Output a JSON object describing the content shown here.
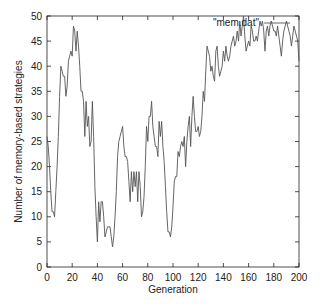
{
  "chart_data": {
    "type": "line",
    "title": "",
    "xlabel": "Generation",
    "ylabel": "Number of memory-based strategies",
    "xlim": [
      0,
      200
    ],
    "ylim": [
      0,
      50
    ],
    "xticks": [
      0,
      20,
      40,
      60,
      80,
      100,
      120,
      140,
      160,
      180,
      200
    ],
    "yticks": [
      0,
      5,
      10,
      15,
      20,
      25,
      30,
      35,
      40,
      45,
      50
    ],
    "grid": false,
    "legend": {
      "position": "top-right-inside",
      "entries": [
        "\"mem.dat\""
      ]
    },
    "series": [
      {
        "name": "\"mem.dat\"",
        "color": "#555555",
        "x": [
          0,
          1,
          2,
          3,
          4,
          5,
          6,
          7,
          8,
          9,
          10,
          11,
          12,
          13,
          14,
          15,
          16,
          17,
          18,
          19,
          20,
          21,
          22,
          23,
          24,
          25,
          26,
          27,
          28,
          29,
          30,
          31,
          32,
          33,
          34,
          35,
          36,
          37,
          38,
          39,
          40,
          41,
          42,
          43,
          44,
          45,
          46,
          47,
          48,
          49,
          50,
          51,
          52,
          53,
          54,
          55,
          56,
          57,
          58,
          59,
          60,
          61,
          62,
          63,
          64,
          65,
          66,
          67,
          68,
          69,
          70,
          71,
          72,
          73,
          74,
          75,
          76,
          77,
          78,
          79,
          80,
          81,
          82,
          83,
          84,
          85,
          86,
          87,
          88,
          89,
          90,
          91,
          92,
          93,
          94,
          95,
          96,
          97,
          98,
          99,
          100,
          101,
          102,
          103,
          104,
          105,
          106,
          107,
          108,
          109,
          110,
          111,
          112,
          113,
          114,
          115,
          116,
          117,
          118,
          119,
          120,
          121,
          122,
          123,
          124,
          125,
          126,
          127,
          128,
          129,
          130,
          131,
          132,
          133,
          134,
          135,
          136,
          137,
          138,
          139,
          140,
          141,
          142,
          143,
          144,
          145,
          146,
          147,
          148,
          149,
          150,
          151,
          152,
          153,
          154,
          155,
          156,
          157,
          158,
          159,
          160,
          161,
          162,
          163,
          164,
          165,
          166,
          167,
          168,
          169,
          170,
          171,
          172,
          173,
          174,
          175,
          176,
          177,
          178,
          179,
          180,
          181,
          182,
          183,
          184,
          185,
          186,
          187,
          188,
          189,
          190,
          191,
          192,
          193,
          194,
          195,
          196,
          197,
          198,
          199,
          200
        ],
        "values": [
          26,
          24,
          20,
          15,
          11,
          11,
          10,
          15,
          20,
          26,
          34,
          40,
          39,
          38,
          38,
          34,
          36,
          41,
          42,
          43,
          42,
          48,
          47,
          43,
          47,
          44,
          40,
          35,
          35,
          33,
          26,
          33,
          28,
          30,
          24,
          25,
          33,
          26,
          16,
          10,
          5,
          13,
          9,
          13,
          13,
          10,
          6,
          7,
          8,
          8,
          8,
          6,
          4,
          6,
          10,
          15,
          22,
          25,
          26,
          27,
          28,
          24,
          22,
          22,
          21,
          17,
          13,
          19,
          15,
          19,
          16,
          19,
          13,
          19,
          16,
          10,
          11,
          14,
          20,
          28,
          25,
          30,
          30,
          33,
          28,
          26,
          24,
          24,
          22,
          29,
          26,
          29,
          24,
          21,
          16,
          11,
          7,
          7,
          6,
          8,
          12,
          17,
          18,
          18,
          23,
          22,
          24,
          25,
          24,
          26,
          20,
          25,
          28,
          30,
          24,
          30,
          34,
          30,
          27,
          27,
          28,
          26,
          27,
          30,
          35,
          33,
          39,
          44,
          43,
          42,
          39,
          40,
          38,
          37,
          43,
          44,
          40,
          38,
          39,
          40,
          43,
          41,
          44,
          42,
          41,
          42,
          44,
          45,
          46,
          44,
          45,
          47,
          45,
          49,
          46,
          48,
          50,
          46,
          43,
          44,
          45,
          44,
          48,
          47,
          45,
          45,
          46,
          45,
          47,
          49,
          48,
          49,
          47,
          43,
          47,
          48,
          46,
          48,
          49,
          48,
          47,
          47,
          46,
          48,
          46,
          44,
          42,
          45,
          47,
          48,
          49,
          48,
          47,
          46,
          44,
          46,
          48,
          47,
          46,
          45,
          41
        ]
      }
    ]
  },
  "plot": {
    "left": 47,
    "right": 299,
    "top": 16,
    "bottom": 267,
    "axis_color": "#222222",
    "line_width": 0.9
  }
}
